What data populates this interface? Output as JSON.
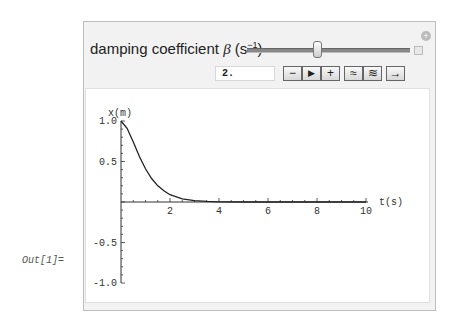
{
  "output_label": "Out[1]=",
  "control": {
    "label_prefix": "damping coefficient ",
    "label_symbol": "β",
    "label_unit_open": " (s",
    "label_unit_exp": "−1",
    "label_unit_close": ")",
    "slider_value": 2.0,
    "input_value": "2.",
    "buttons": {
      "decrement": "−",
      "play": "▶",
      "increment": "+",
      "faster": "≈",
      "slower": "≋",
      "direction": "→"
    },
    "add_icon": "+"
  },
  "chart_data": {
    "type": "line",
    "title": "",
    "xlabel": "t(s)",
    "ylabel": "x(m)",
    "xlim": [
      0,
      10
    ],
    "ylim": [
      -1.0,
      1.0
    ],
    "x_ticks": [
      "2",
      "4",
      "6",
      "8",
      "10"
    ],
    "y_ticks": [
      "1.0",
      "0.5",
      "-0.5",
      "-1.0"
    ],
    "grid": false,
    "legend": null,
    "series": [
      {
        "name": "x(t)",
        "x": [
          0,
          0.25,
          0.5,
          0.75,
          1.0,
          1.25,
          1.5,
          1.75,
          2.0,
          2.5,
          3.0,
          3.5,
          4.0,
          5.0,
          6.0,
          7.0,
          8.0,
          9.0,
          10.0
        ],
        "values": [
          1.0,
          0.91,
          0.74,
          0.56,
          0.41,
          0.29,
          0.2,
          0.14,
          0.09,
          0.04,
          0.017,
          0.007,
          0.003,
          0.0005,
          0.0001,
          0,
          0,
          0,
          0
        ]
      }
    ]
  }
}
